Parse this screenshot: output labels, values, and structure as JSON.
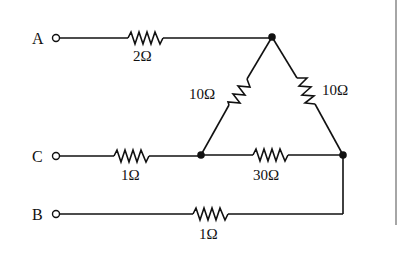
{
  "diagram": {
    "type": "circuit",
    "terminals": [
      {
        "id": "A",
        "label": "A"
      },
      {
        "id": "C",
        "label": "C"
      },
      {
        "id": "B",
        "label": "B"
      }
    ],
    "resistors": [
      {
        "id": "RA",
        "label": "2Ω",
        "ohms": 2,
        "between": [
          "A",
          "top-node"
        ]
      },
      {
        "id": "RC",
        "label": "1Ω",
        "ohms": 1,
        "between": [
          "C",
          "left-node"
        ]
      },
      {
        "id": "RB",
        "label": "1Ω",
        "ohms": 1,
        "between": [
          "B",
          "right-node"
        ]
      },
      {
        "id": "R_left",
        "label": "10Ω",
        "ohms": 10,
        "between": [
          "top-node",
          "left-node"
        ]
      },
      {
        "id": "R_right",
        "label": "10Ω",
        "ohms": 10,
        "between": [
          "top-node",
          "right-node"
        ]
      },
      {
        "id": "R_bottom",
        "label": "30Ω",
        "ohms": 30,
        "between": [
          "left-node",
          "right-node"
        ]
      }
    ],
    "nodes": [
      "top-node",
      "left-node",
      "right-node"
    ]
  }
}
